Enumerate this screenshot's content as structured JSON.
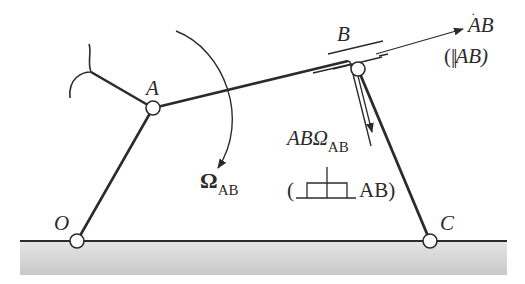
{
  "diagram": {
    "type": "planar-linkage-kinematics",
    "colors": {
      "stroke": "#2b2b2b",
      "ground_fill": "#d6d6d6",
      "background": "#ffffff"
    },
    "joints": [
      {
        "id": "O",
        "label": "O",
        "x": 77,
        "y": 241
      },
      {
        "id": "A",
        "label": "A",
        "x": 153,
        "y": 108
      },
      {
        "id": "B",
        "label": "B",
        "x": 358,
        "y": 69
      },
      {
        "id": "C",
        "label": "C",
        "x": 430,
        "y": 241
      }
    ],
    "labels": {
      "O": "O",
      "A": "A",
      "B": "B",
      "C": "C",
      "omega_symbol": "Ω",
      "omega_sub": "AB",
      "bdot_main": "AB",
      "bdot_paren_open": "(",
      "bdot_parallel": "||",
      "bdot_paren_ref": "AB)",
      "cross_term_main": "ABΩ",
      "cross_term_sub": "AB",
      "perp_paren_open": "(",
      "perp_paren_ref": "AB)"
    },
    "annotations": [
      "Angular velocity Ω_AB (clockwise arc arrow)",
      "Relative velocity Ȧ B parallel to AB",
      "AB·Ω_AB perpendicular to AB"
    ]
  }
}
